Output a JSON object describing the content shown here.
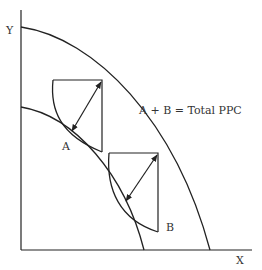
{
  "diagram": {
    "title": "",
    "axes": {
      "y_label": "Y",
      "x_label": "X"
    },
    "curves": {
      "outer_ppc": {
        "name": "Total PPC (outer)"
      },
      "inner_ppc": {
        "name": "Inner PPC"
      }
    },
    "points": {
      "a_label": "A",
      "b_label": "B"
    },
    "annotation": "A + B = Total PPC",
    "colors": {
      "stroke": "#222222",
      "text": "#333333",
      "background": "#ffffff"
    }
  }
}
